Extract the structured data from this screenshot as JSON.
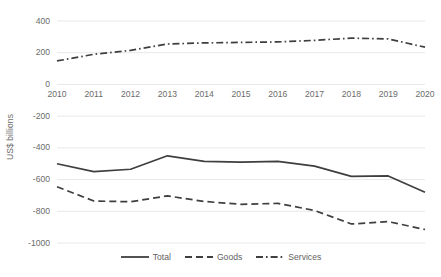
{
  "chart_data": {
    "type": "line",
    "title": "",
    "xlabel": "",
    "ylabel": "US$ billions",
    "categories": [
      "2010",
      "2011",
      "2012",
      "2013",
      "2014",
      "2015",
      "2016",
      "2017",
      "2018",
      "2019",
      "2020"
    ],
    "x": [
      2010,
      2011,
      2012,
      2013,
      2014,
      2015,
      2016,
      2017,
      2018,
      2019,
      2020
    ],
    "ylim": [
      -1000,
      400
    ],
    "yticks": [
      400,
      200,
      0,
      -200,
      -400,
      -600,
      -800,
      -1000
    ],
    "ytick_labels": [
      "400",
      "200",
      "0",
      "-200",
      "-400",
      "-600",
      "-800",
      "-1000"
    ],
    "grid": true,
    "grid_axis": "y",
    "legend_position": "bottom",
    "series": [
      {
        "name": "Total",
        "style": "solid",
        "color": "#3f3f3f",
        "values": [
          -500,
          -550,
          -535,
          -450,
          -485,
          -490,
          -485,
          -515,
          -580,
          -577,
          -680
        ]
      },
      {
        "name": "Goods",
        "style": "dashed",
        "color": "#3f3f3f",
        "values": [
          -645,
          -735,
          -740,
          -703,
          -738,
          -756,
          -750,
          -795,
          -880,
          -865,
          -915
        ]
      },
      {
        "name": "Services",
        "style": "dashdot",
        "color": "#3f3f3f",
        "values": [
          148,
          190,
          215,
          255,
          262,
          265,
          268,
          278,
          292,
          287,
          235
        ]
      }
    ]
  },
  "legend": {
    "items": [
      {
        "label": "Total",
        "style": "solid"
      },
      {
        "label": "Goods",
        "style": "dashed"
      },
      {
        "label": "Services",
        "style": "dashdot"
      }
    ]
  },
  "axes": {
    "y_title": "US$ billions"
  },
  "colors": {
    "line": "#3f3f3f",
    "grid": "#e8e8e8",
    "text": "#6b6b6b",
    "background": "#ffffff"
  }
}
